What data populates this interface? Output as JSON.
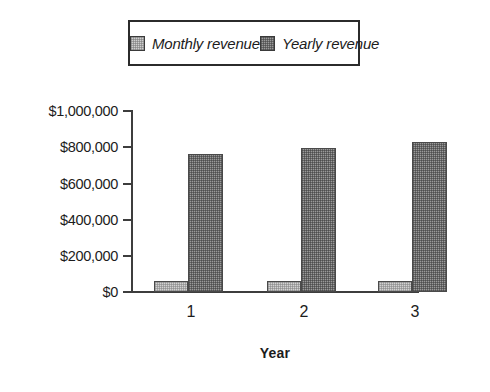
{
  "chart_data": {
    "type": "bar",
    "title": "",
    "subtitle": "",
    "xlabel": "Year",
    "ylabel": "",
    "categories": [
      "1",
      "2",
      "3"
    ],
    "series": [
      {
        "name": "Monthly revenue",
        "values": [
          60000,
          60000,
          60000
        ],
        "color": "#d2d2d2"
      },
      {
        "name": "Yearly revenue",
        "values": [
          765000,
          795000,
          830000
        ],
        "color": "#9a9a9a"
      }
    ],
    "ylim": [
      0,
      1000000
    ],
    "ytick_values": [
      0,
      200000,
      400000,
      600000,
      800000,
      1000000
    ],
    "ytick_labels": [
      "$0",
      "$200,000",
      "$400,000",
      "$600,000",
      "$800,000",
      "$1,000,000"
    ],
    "grid": false,
    "legend_position": "top"
  },
  "legend": {
    "entries": [
      {
        "label": "Monthly revenue",
        "swatch": "light-gray-stipple-swatch"
      },
      {
        "label": "Yearly revenue",
        "swatch": "dark-gray-stipple-swatch"
      }
    ]
  },
  "axes": {
    "x_title": "Year",
    "x_labels": [
      "1",
      "2",
      "3"
    ],
    "y_labels": [
      "$1,000,000",
      "$800,000",
      "$600,000",
      "$400,000",
      "$200,000",
      "$0"
    ]
  }
}
